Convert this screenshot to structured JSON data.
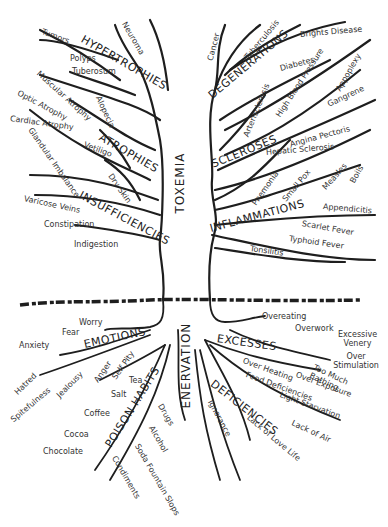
{
  "trunk": {
    "upper": "TOXEMIA",
    "lower": "ENERVATION"
  },
  "branches": {
    "hypertrophies": {
      "label": "HYPERTROPHIES",
      "items": [
        "Tumors",
        "Polyps",
        "Tuberosum",
        "Neuroma"
      ]
    },
    "atrophies": {
      "label": "ATROPHIES",
      "items": [
        "Muscular Atrophy",
        "Optic Atrophy",
        "Cardiac Atrophy",
        "Alopecia",
        "Vetiligo"
      ]
    },
    "insufficiencies": {
      "label": "INSUFFICIENCIES",
      "items": [
        "Glandular Imbalance",
        "Dry Skin",
        "Varicose Veins",
        "Constipation",
        "Indigestion"
      ]
    },
    "degenerations": {
      "label": "DEGENERATIONS",
      "items": [
        "Cancer",
        "Tuberculosis",
        "Brights Disease",
        "Diabetes"
      ]
    },
    "scleroses": {
      "label": "SCLEROSES",
      "items": [
        "Arterisclerosis",
        "High Blood Pressure",
        "Appoplexy",
        "Gangrene",
        "Angina Pectoris",
        "Hepatic Sclerosis"
      ]
    },
    "inflammations": {
      "label": "INFLAMMATIONS",
      "items": [
        "Pnemonia",
        "Small Pox",
        "Measles",
        "Boils",
        "Appendicitis",
        "Scarlet Fever",
        "Typhoid Fever",
        "Tonsilitis"
      ]
    }
  },
  "roots": {
    "emotions": {
      "label": "EMOTIONS",
      "items": [
        "Worry",
        "Fear",
        "Anxiety",
        "Hatred",
        "Spitefulness",
        "Jealousy",
        "Anger",
        "Self Pity"
      ]
    },
    "poison_habits": {
      "label": "POISON HABITS",
      "items": [
        "Tea",
        "Salt",
        "Coffee",
        "Cocoa",
        "Chocolate",
        "Condiments",
        "Soda Fountain Slops",
        "Alcohol",
        "Drugs"
      ]
    },
    "excesses": {
      "label": "EXCESSES",
      "items": [
        "Overeating",
        "Overwork",
        "Excessive Venery",
        "Over Stimulation",
        "Too Much Bathing",
        "Over Heating",
        "Over Exposure"
      ]
    },
    "deficiencies": {
      "label": "DEFICIENCIES",
      "items": [
        "Food Deficiencies",
        "Light Starvation",
        "Lack of Air",
        "Lack of Love Life",
        "Ignorance"
      ]
    }
  },
  "colors": {
    "ink": "#1e1e1e",
    "background": "#ffffff"
  }
}
